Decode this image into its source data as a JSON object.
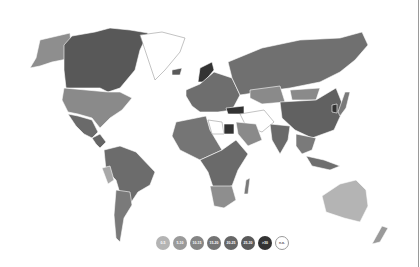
{
  "map": {
    "type": "choropleth-world",
    "ocean_color": "#ffffff",
    "border_color": "#ffffff"
  },
  "legend": {
    "items": [
      {
        "label": "0-5",
        "color": "#b4b4b4"
      },
      {
        "label": "5-10",
        "color": "#9a9a9a"
      },
      {
        "label": "10-15",
        "color": "#858585"
      },
      {
        "label": "15-20",
        "color": "#747474"
      },
      {
        "label": "20-25",
        "color": "#676767"
      },
      {
        "label": "25-30",
        "color": "#5a5a5a"
      },
      {
        "label": ">30",
        "color": "#333333"
      },
      {
        "label": "n.a.",
        "color": "#ffffff"
      }
    ]
  },
  "regions": {
    "alaska": "#8e8e8e",
    "canada": "#585858",
    "greenland": "#ffffff",
    "usa": "#8a8a8a",
    "mexico": "#6a6a6a",
    "central_america": "#656565",
    "south_america": "#6c6c6c",
    "peru": "#a8a8a8",
    "argentina": "#7a7a7a",
    "europe": "#6e6e6e",
    "norway": "#333333",
    "iceland": "#5a5a5a",
    "russia": "#707070",
    "kazakhstan": "#8a8a8a",
    "mongolia": "#8a8a8a",
    "china": "#616161",
    "turkey": "#333333",
    "egypt": "#333333",
    "middle_east": "#ffffff",
    "saudi": "#8a8a8a",
    "india": "#6a6a6a",
    "north_africa": "#757575",
    "libya": "#ffffff",
    "central_africa": "#6a6a6a",
    "south_africa": "#8e8e8e",
    "madagascar": "#7a7a7a",
    "southeast_asia": "#7a7a7a",
    "indonesia": "#6e6e6e",
    "australia": "#b4b4b4",
    "new_zealand": "#9a9a9a",
    "japan": "#7a7a7a",
    "korea": "#333333"
  }
}
